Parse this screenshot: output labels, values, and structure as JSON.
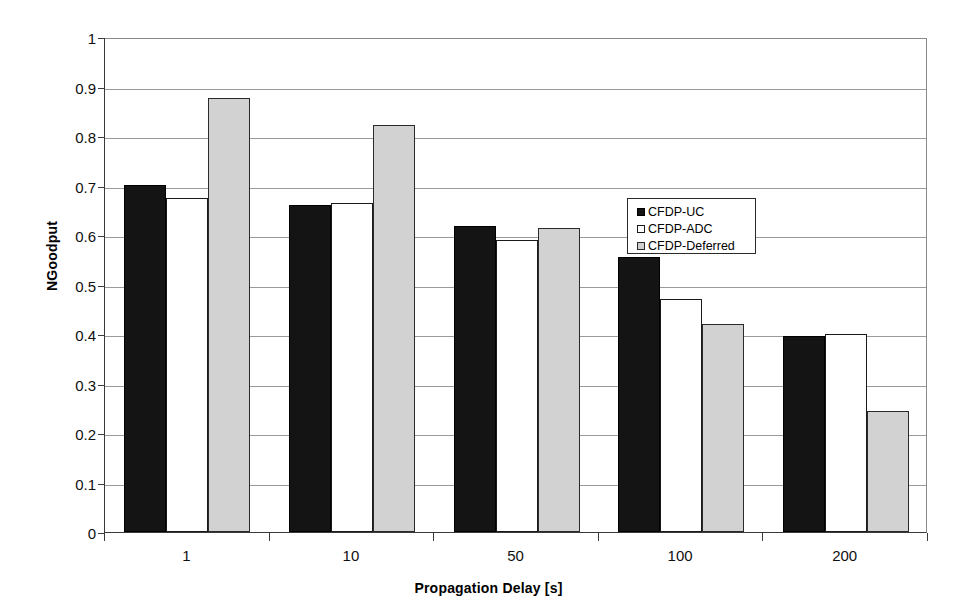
{
  "chart_data": {
    "type": "bar",
    "title": "",
    "subtitle": "",
    "xlabel": "Propagation Delay [s]",
    "ylabel": "NGoodput",
    "categories": [
      "1",
      "10",
      "50",
      "100",
      "200"
    ],
    "series": [
      {
        "name": "CFDP-UC",
        "color": "#141414",
        "values": [
          0.702,
          0.661,
          0.618,
          0.555,
          0.397
        ]
      },
      {
        "name": "CFDP-ADC",
        "color": "#ffffff",
        "values": [
          0.675,
          0.664,
          0.59,
          0.47,
          0.4
        ]
      },
      {
        "name": "CFDP-Deferred",
        "color": "#d2d2d2",
        "values": [
          0.877,
          0.823,
          0.614,
          0.42,
          0.245
        ]
      }
    ],
    "ylim": [
      0,
      1
    ],
    "ytick_values": [
      0,
      0.1,
      0.2,
      0.3,
      0.4,
      0.5,
      0.6,
      0.7,
      0.8,
      0.9,
      1
    ],
    "ytick_labels": [
      "0",
      "0.1",
      "0.2",
      "0.3",
      "0.4",
      "0.5",
      "0.6",
      "0.7",
      "0.8",
      "0.9",
      "1"
    ],
    "grid": true,
    "grid_axis": "y",
    "legend_position": "center-right-inside",
    "legend_entries": [
      "CFDP-UC",
      "CFDP-ADC",
      "CFDP-Deferred"
    ]
  }
}
